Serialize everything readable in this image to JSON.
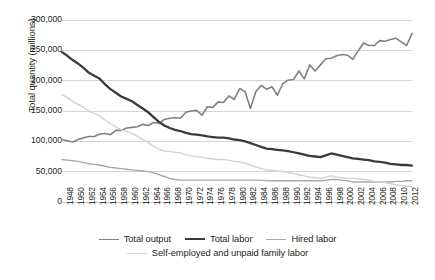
{
  "chart_data": {
    "type": "line",
    "title": "",
    "xlabel": "",
    "ylabel": "Total quantity (millions)",
    "ylim": [
      0,
      300000
    ],
    "ytick_values": [
      300000,
      250000,
      200000,
      150000,
      100000,
      50000,
      0
    ],
    "ytick_labels": [
      "300,000",
      "250,000",
      "200,000",
      "150,000",
      "100,000",
      "50,000",
      "0"
    ],
    "grid": "horizontal",
    "legend_position": "bottom",
    "x": [
      1948,
      1949,
      1950,
      1951,
      1952,
      1953,
      1954,
      1955,
      1956,
      1957,
      1958,
      1959,
      1960,
      1961,
      1962,
      1963,
      1964,
      1965,
      1966,
      1967,
      1968,
      1969,
      1970,
      1971,
      1972,
      1973,
      1974,
      1975,
      1976,
      1977,
      1978,
      1979,
      1980,
      1981,
      1982,
      1983,
      1984,
      1985,
      1986,
      1987,
      1988,
      1989,
      1990,
      1991,
      1992,
      1993,
      1994,
      1995,
      1996,
      1997,
      1998,
      1999,
      2000,
      2001,
      2002,
      2003,
      2004,
      2005,
      2006,
      2007,
      2008,
      2009,
      2010,
      2011,
      2012,
      2013
    ],
    "xtick_labels": [
      "1948",
      "1950",
      "1952",
      "1954",
      "1956",
      "1958",
      "1960",
      "1962",
      "1964",
      "1966",
      "1968",
      "1970",
      "1972",
      "1974",
      "1976",
      "1978",
      "1980",
      "1982",
      "1984",
      "1986",
      "1988",
      "1990",
      "1992",
      "1994",
      "1996",
      "1998",
      "2000",
      "2002",
      "2004",
      "2006",
      "2008",
      "2010",
      "2012"
    ],
    "series": [
      {
        "name": "Total output",
        "color": "#808285",
        "width": 1.6,
        "values": [
          103000,
          101000,
          99000,
          103000,
          106000,
          108000,
          108000,
          112000,
          113000,
          111000,
          118000,
          118000,
          122000,
          123000,
          124000,
          128000,
          126000,
          131000,
          130000,
          136000,
          138000,
          139000,
          138000,
          148000,
          150000,
          151000,
          143000,
          157000,
          156000,
          165000,
          164000,
          175000,
          169000,
          187000,
          182000,
          154000,
          182000,
          192000,
          186000,
          190000,
          176000,
          195000,
          201000,
          202000,
          216000,
          203000,
          226000,
          216000,
          226000,
          236000,
          237000,
          241000,
          243000,
          242000,
          235000,
          249000,
          262000,
          258000,
          258000,
          266000,
          265000,
          268000,
          270000,
          264000,
          258000,
          278000
        ]
      },
      {
        "name": "Total labor",
        "color": "#3b3b3d",
        "width": 2.3,
        "values": [
          247000,
          241000,
          234000,
          228000,
          221000,
          213000,
          208000,
          203000,
          194000,
          186000,
          180000,
          174000,
          170000,
          166000,
          160000,
          154000,
          148000,
          140000,
          132000,
          126000,
          122000,
          119000,
          117000,
          114000,
          112000,
          111000,
          110000,
          108000,
          107000,
          106000,
          106000,
          105000,
          103000,
          102000,
          100000,
          97000,
          94000,
          91000,
          88000,
          87000,
          86000,
          85000,
          84000,
          82000,
          80000,
          78000,
          76000,
          75000,
          74000,
          77000,
          80000,
          78000,
          76000,
          74000,
          72000,
          71000,
          70000,
          69000,
          67000,
          66000,
          65000,
          63000,
          62000,
          61000,
          61000,
          60000
        ]
      },
      {
        "name": "Hired labor",
        "color": "#a7a9ac",
        "width": 1.4,
        "values": [
          70000,
          69000,
          68000,
          67000,
          65000,
          63000,
          62000,
          61000,
          59000,
          57000,
          56000,
          55000,
          54000,
          53000,
          52000,
          51000,
          50000,
          48000,
          45000,
          42000,
          39000,
          37000,
          36000,
          36000,
          36000,
          36000,
          36000,
          36000,
          36000,
          36000,
          36000,
          36000,
          36000,
          36000,
          36000,
          36000,
          36000,
          36000,
          35000,
          35000,
          35000,
          35000,
          35000,
          35000,
          35000,
          35000,
          35000,
          35000,
          35000,
          36000,
          37000,
          37000,
          36000,
          35000,
          33000,
          33000,
          33000,
          33000,
          33000,
          33000,
          33000,
          33000,
          34000,
          34000,
          35000,
          35000
        ]
      },
      {
        "name": "Self-employed and unpaid family labor",
        "color": "#d1d3d4",
        "width": 1.4,
        "values": [
          177000,
          172000,
          166000,
          161000,
          156000,
          150000,
          146000,
          142000,
          135000,
          129000,
          124000,
          119000,
          116000,
          113000,
          108000,
          103000,
          98000,
          92000,
          87000,
          84000,
          83000,
          82000,
          81000,
          78000,
          76000,
          75000,
          74000,
          72000,
          71000,
          70000,
          70000,
          69000,
          67000,
          66000,
          64000,
          61000,
          58000,
          55000,
          53000,
          52000,
          51000,
          50000,
          49000,
          47000,
          45000,
          43000,
          41000,
          40000,
          39000,
          41000,
          43000,
          41000,
          40000,
          39000,
          39000,
          38000,
          37000,
          36000,
          34000,
          33000,
          32000,
          30000,
          28000,
          27000,
          26000,
          25000
        ]
      }
    ]
  },
  "legend": {
    "items": [
      {
        "label": "Total output"
      },
      {
        "label": "Total labor"
      },
      {
        "label": "Hired labor"
      },
      {
        "label": "Self-employed and unpaid family labor"
      }
    ]
  },
  "caption": ""
}
